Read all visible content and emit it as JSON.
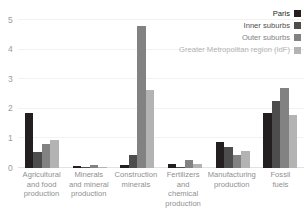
{
  "chart_data": {
    "type": "bar",
    "title": "",
    "xlabel": "",
    "ylabel": "",
    "ylim": [
      0,
      5
    ],
    "yticks": [
      0,
      1,
      2,
      3,
      4,
      5
    ],
    "ytick_labels": [
      "0",
      "1",
      "2",
      "3",
      "4",
      "5"
    ],
    "grid": true,
    "legend_position": "top-right",
    "categories": [
      "Agricultural\nand food\nproduction",
      "Minerals\nand mineral\nproduction",
      "Construction\nminerals",
      "Fertilizers\nand\nchemical\nproduction",
      "Manufacturing\nproduction",
      "Fossil\nfuels"
    ],
    "series": [
      {
        "name": "Paris",
        "color": "#231f20",
        "values": [
          1.85,
          0.07,
          0.1,
          0.12,
          0.87,
          1.85
        ]
      },
      {
        "name": "Inner suburbs",
        "color": "#4d4d4d",
        "values": [
          0.55,
          0.04,
          0.45,
          0.05,
          0.72,
          2.25
        ]
      },
      {
        "name": "Outer suburbs",
        "color": "#828282",
        "values": [
          0.8,
          0.1,
          4.8,
          0.27,
          0.43,
          2.7
        ]
      },
      {
        "name": "Greater Metropolitan region (IdF)",
        "color": "#b3b3b3",
        "values": [
          0.93,
          0.04,
          2.65,
          0.15,
          0.58,
          1.8
        ]
      }
    ]
  },
  "legend": {
    "items": [
      {
        "label": "Paris",
        "color": "#231f20",
        "text_color": "#231f20"
      },
      {
        "label": "Inner suburbs",
        "color": "#4d4d4d",
        "text_color": "#4d4d4d"
      },
      {
        "label": "Outer suburbs",
        "color": "#828282",
        "text_color": "#828282"
      },
      {
        "label": "Greater Metropolitan region (IdF)",
        "color": "#b3b3b3",
        "text_color": "#b3b3b3"
      }
    ]
  }
}
